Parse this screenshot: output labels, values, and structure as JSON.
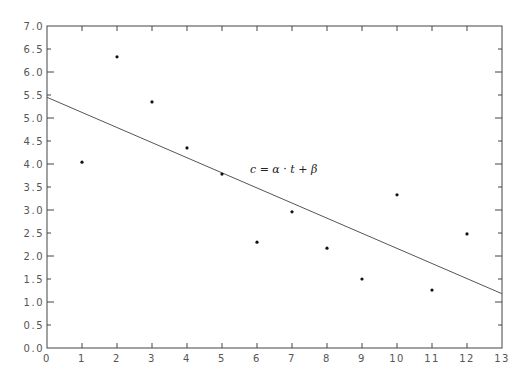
{
  "chart_data": {
    "type": "scatter",
    "title": "",
    "xlabel": "",
    "ylabel": "",
    "xlim": [
      0,
      13
    ],
    "ylim": [
      0,
      7
    ],
    "grid": false,
    "legend": null,
    "x_ticks": [
      "0",
      "1",
      "2",
      "3",
      "4",
      "5",
      "6",
      "7",
      "8",
      "9",
      "10",
      "11",
      "12",
      "13"
    ],
    "y_ticks": [
      "0.0",
      "0.5",
      "1.0",
      "1.5",
      "2.0",
      "2.5",
      "3.0",
      "3.5",
      "4.0",
      "4.5",
      "5.0",
      "5.5",
      "6.0",
      "6.5",
      "7.0"
    ],
    "series": [
      {
        "name": "observations",
        "type": "scatter",
        "x": [
          1,
          2,
          3,
          4,
          5,
          6,
          7,
          8,
          9,
          10,
          11,
          12
        ],
        "y": [
          4.04,
          6.33,
          5.35,
          4.35,
          3.78,
          2.3,
          2.96,
          2.17,
          1.5,
          3.33,
          1.26,
          2.48
        ]
      },
      {
        "name": "linear fit",
        "type": "line",
        "x": [
          0,
          13
        ],
        "y": [
          5.45,
          1.18
        ]
      }
    ],
    "annotations": [
      {
        "text": "c = α · t + β",
        "x": 5.8,
        "y": 3.8
      }
    ],
    "colors": {
      "points": "#111111",
      "fit_line": "#555555",
      "axes": "#444444",
      "labels": "#555555"
    }
  }
}
